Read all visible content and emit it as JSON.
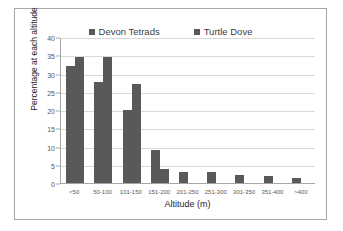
{
  "chart_data": {
    "type": "bar",
    "title": "",
    "subtitle": "",
    "xlabel": "Altitude (m)",
    "ylabel": "Percentage at each altitude",
    "categories": [
      "<50",
      "50-100",
      "101-150",
      "151-200",
      "201-250",
      "251-300",
      "301-350",
      "351-400",
      ">400"
    ],
    "series": [
      {
        "name": "Devon Tetrads",
        "values": [
          32,
          27.8,
          20,
          9,
          2.9,
          2.9,
          2.2,
          1.8,
          1.5
        ]
      },
      {
        "name": "Turtle Dove",
        "values": [
          34.5,
          34.5,
          27,
          3.8,
          0,
          0,
          0,
          0,
          0
        ]
      }
    ],
    "ylim": [
      0,
      40
    ],
    "ytick_step": 5,
    "yticks": [
      "0",
      "5",
      "10",
      "15",
      "20",
      "25",
      "30",
      "35",
      "40"
    ],
    "grid": "horizontal",
    "legend_position": "top-center",
    "bar_color": "#595959",
    "grid_color": "#d9d9d9",
    "axis_color": "#a6a6a6",
    "background": "#ffffff"
  }
}
